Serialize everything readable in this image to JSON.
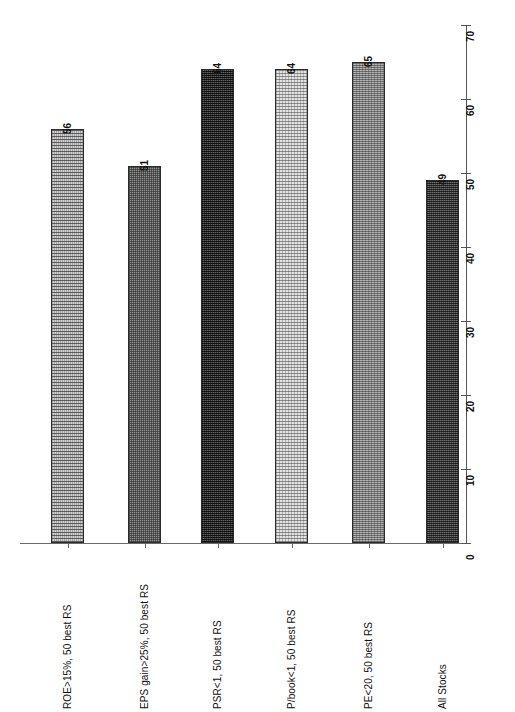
{
  "chart_data": {
    "type": "bar",
    "title": "",
    "subtitle": "",
    "xlabel": "",
    "ylabel": "",
    "ylim": [
      0,
      70
    ],
    "grid": false,
    "legend": null,
    "orientation": "vertical",
    "axis_position": "right",
    "label_rotation": -90,
    "categories": [
      "ROE>15%, 50 best RS",
      "EPS gain>25%, 50 best RS",
      "PSR<1, 50 best RS",
      "P/book<1, 50 best RS",
      "PE<20, 50 best RS",
      "All Stocks"
    ],
    "values": [
      56,
      51,
      64,
      64,
      65,
      49
    ],
    "value_labels": [
      "56",
      "51",
      "64",
      "64",
      "65",
      "49"
    ],
    "yticks": [
      0,
      10,
      20,
      30,
      40,
      50,
      60,
      70
    ],
    "ytick_labels": [
      "0",
      "10",
      "20",
      "30",
      "40",
      "50",
      "60",
      "70"
    ],
    "bar_fills": [
      "hatch-light",
      "check-mid",
      "dense-dark",
      "dot-pale",
      "grain-mid",
      "dark-even"
    ],
    "colors": {
      "bar_border": "#2b2b2b",
      "axis": "#555555",
      "baseline": "#6a6a6a",
      "text": "#111111",
      "background": "#ffffff"
    }
  }
}
